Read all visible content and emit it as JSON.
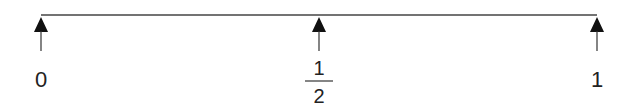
{
  "diagram": {
    "type": "number-line",
    "line_color": "#333333",
    "points": [
      {
        "value": 0,
        "label": "0",
        "x": 41
      },
      {
        "value": 0.5,
        "label_numerator": "1",
        "label_denominator": "2",
        "x": 319
      },
      {
        "value": 1,
        "label": "1",
        "x": 597
      }
    ]
  }
}
